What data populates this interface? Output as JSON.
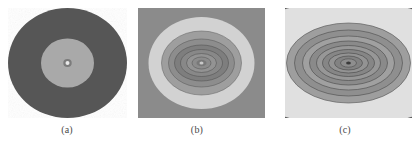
{
  "figure": {
    "background": "#ffffff",
    "width": 419,
    "height": 144,
    "panels": [
      {
        "id": "a",
        "caption": "(a)",
        "shape": "circle",
        "caption_center_x": 67,
        "box": {
          "x": 8,
          "y": 8,
          "w": 119,
          "h": 110
        },
        "description": "isotropic circular field, two flat levels with bright core point",
        "colors": {
          "outer": "#565656",
          "inner": "#a9a9a9",
          "core_ring": "#7a7a7a",
          "core_dot": "#e8e8e8"
        },
        "levels": [
          {
            "name": "outer-disk",
            "rx": 59.5,
            "ry": 55,
            "fill": "#565656"
          },
          {
            "name": "inner-disk",
            "rx": 26.5,
            "ry": 24.5,
            "fill": "#a9a9a9"
          },
          {
            "name": "core-ring",
            "rx": 4.2,
            "ry": 4.0,
            "fill": "#7b7b7b"
          },
          {
            "name": "core-dot",
            "rx": 2.0,
            "ry": 1.9,
            "fill": "#e9e9e9"
          }
        ]
      },
      {
        "id": "b",
        "caption": "(b)",
        "shape": "square",
        "caption_center_x": 197,
        "box": {
          "x": 138,
          "y": 8,
          "w": 127,
          "h": 110
        },
        "description": "elliptical contour field, bright annulus with nested dark elliptical rings",
        "colors": {
          "background": "#8b8b8b",
          "bright_ring": "#d2d2d2",
          "mid_ring": "#9c9c9c",
          "dark_ring": "#6f6f6f",
          "contour_line": "#4a4a4a"
        },
        "levels": [
          {
            "name": "field-background",
            "rx": 63.5,
            "ry": 55,
            "fill": "#8b8b8b"
          },
          {
            "name": "bright-annulus",
            "rx": 53,
            "ry": 46,
            "fill": "#d2d2d2"
          },
          {
            "name": "mid-band-1",
            "rx": 40,
            "ry": 32,
            "fill": "#9e9e9e"
          },
          {
            "name": "mid-band-2",
            "rx": 33,
            "ry": 24,
            "fill": "#8d8d8d"
          },
          {
            "name": "dark-band-1",
            "rx": 27,
            "ry": 18,
            "fill": "#7e7e7e"
          },
          {
            "name": "dark-band-2",
            "rx": 21,
            "ry": 13.5,
            "fill": "#888888"
          },
          {
            "name": "dark-band-3",
            "rx": 15,
            "ry": 9.5,
            "fill": "#939393"
          },
          {
            "name": "dark-band-4",
            "rx": 9.5,
            "ry": 6,
            "fill": "#8c8c8c"
          },
          {
            "name": "core-ring",
            "rx": 5,
            "ry": 3.2,
            "fill": "#787878"
          },
          {
            "name": "core-dot",
            "rx": 2,
            "ry": 1.5,
            "fill": "#c8c8c8"
          }
        ]
      },
      {
        "id": "c",
        "caption": "(c)",
        "shape": "square",
        "caption_center_x": 345,
        "box": {
          "x": 285,
          "y": 8,
          "w": 127,
          "h": 110
        },
        "description": "strongly anisotropic field, wide horizontal bands with many nested flat ellipses",
        "colors": {
          "dark_band": "#5d5d5d",
          "bright_band": "#e0e0e0",
          "mid_band": "#9a9a9a",
          "inner_band": "#7f7f7f",
          "contour_line": "#3f3f3f"
        },
        "levels": [
          {
            "name": "outer-dark-band",
            "rx": 150,
            "ry": 86,
            "fill": "#5d5d5d"
          },
          {
            "name": "bright-band",
            "rx": 128,
            "ry": 62,
            "fill": "#e0e0e0"
          },
          {
            "name": "mid-band-1",
            "rx": 62,
            "ry": 40,
            "fill": "#9e9e9e"
          },
          {
            "name": "mid-band-2",
            "rx": 54,
            "ry": 33,
            "fill": "#8f8f8f"
          },
          {
            "name": "mid-band-3",
            "rx": 46,
            "ry": 27,
            "fill": "#a0a0a0"
          },
          {
            "name": "mid-band-4",
            "rx": 39,
            "ry": 22,
            "fill": "#8a8a8a"
          },
          {
            "name": "inner-band-1",
            "rx": 32,
            "ry": 17.5,
            "fill": "#979797"
          },
          {
            "name": "inner-band-2",
            "rx": 26,
            "ry": 13.5,
            "fill": "#868686"
          },
          {
            "name": "inner-band-3",
            "rx": 20,
            "ry": 10,
            "fill": "#939393"
          },
          {
            "name": "inner-band-4",
            "rx": 14,
            "ry": 7,
            "fill": "#828282"
          },
          {
            "name": "core-ring",
            "rx": 8,
            "ry": 4.2,
            "fill": "#8e8e8e"
          },
          {
            "name": "core-dot",
            "rx": 2.4,
            "ry": 1.6,
            "fill": "#3a3a3a"
          }
        ]
      }
    ]
  }
}
